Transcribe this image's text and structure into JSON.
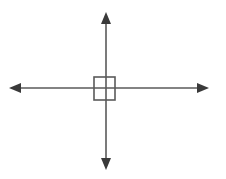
{
  "figure": {
    "background_color": "#ffffff",
    "width": 226,
    "height": 179,
    "stroke_color": "#5a5a5a",
    "arrow_color": "#3a3a3a",
    "box_color": "#5a5a5a",
    "stroke_width": 1.6,
    "box_stroke_width": 1.6
  },
  "chart_data": {
    "type": "diagram",
    "xlabel": "",
    "ylabel": "",
    "legend": [],
    "annotations": [],
    "grid": false,
    "elements": [
      {
        "name": "horizontal-axis",
        "kind": "double-headed-arrow",
        "orientation": "horizontal",
        "x1": 9,
        "y1": 88,
        "x2": 209,
        "y2": 88,
        "arrowheads": [
          "start",
          "end"
        ],
        "color": "#5a5a5a"
      },
      {
        "name": "vertical-axis",
        "kind": "double-headed-arrow",
        "orientation": "vertical",
        "x1": 106,
        "y1": 12,
        "x2": 106,
        "y2": 170,
        "arrowheads": [
          "start",
          "end"
        ],
        "color": "#5a5a5a"
      },
      {
        "name": "center-square",
        "kind": "rectangle",
        "x": 94,
        "y": 77,
        "width": 21,
        "height": 23,
        "fill": "none",
        "color": "#5a5a5a"
      }
    ],
    "intersection_point": {
      "x": 106,
      "y": 88
    }
  }
}
